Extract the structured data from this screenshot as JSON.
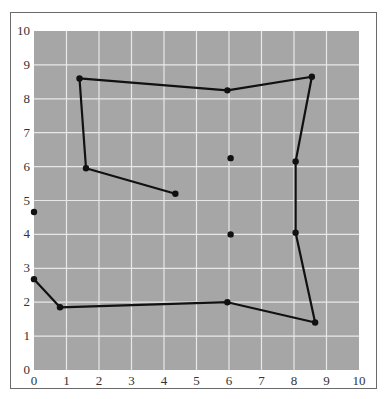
{
  "chart_data": {
    "type": "line",
    "title": "",
    "xlabel": "",
    "ylabel": "",
    "xlim": [
      0,
      10
    ],
    "ylim": [
      0,
      10
    ],
    "grid": true,
    "legend": null,
    "x_ticks": [
      "0",
      "1",
      "2",
      "3",
      "4",
      "5",
      "6",
      "7",
      "8",
      "9",
      "10"
    ],
    "y_ticks": [
      "0",
      "1",
      "2",
      "3",
      "4",
      "5",
      "6",
      "7",
      "8",
      "9",
      "10"
    ],
    "series": [
      {
        "name": "path",
        "style": "line+markers",
        "points": [
          [
            4.35,
            5.2
          ],
          [
            1.6,
            5.95
          ],
          [
            1.4,
            8.6
          ],
          [
            5.95,
            8.25
          ],
          [
            8.55,
            8.65
          ],
          [
            8.05,
            6.15
          ],
          [
            8.05,
            4.05
          ],
          [
            8.65,
            1.4
          ],
          [
            5.95,
            2.0
          ],
          [
            0.8,
            1.85
          ],
          [
            0.0,
            2.68
          ]
        ]
      },
      {
        "name": "isolated",
        "style": "markers",
        "points": [
          [
            6.05,
            6.25
          ],
          [
            6.05,
            4.0
          ],
          [
            0.0,
            4.66
          ]
        ]
      }
    ],
    "colors": {
      "plot_background": "#a6a6a6",
      "grid": "#e8e8e8",
      "line": "#111111",
      "marker": "#111111"
    }
  }
}
